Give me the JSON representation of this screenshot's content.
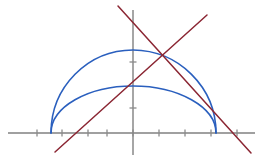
{
  "figure": {
    "name": "semicircle-and-ellipse-with-crossing-lines",
    "width": 262,
    "height": 160,
    "background": "#ffffff"
  },
  "chart_data": {
    "type": "line",
    "title": "",
    "subtitle": "",
    "xlabel": "",
    "ylabel": "",
    "grid": false,
    "legend": "none",
    "axes": {
      "origin_px": [
        133,
        133
      ],
      "x_axis": {
        "y_px": 133,
        "x_start_px": 8,
        "x_end_px": 255,
        "xlim": [
          -4.9,
          4.7
        ],
        "tick_spacing_units": 1,
        "tick_values": [
          -4,
          -3,
          -2,
          -1,
          0,
          1,
          2,
          3,
          4
        ],
        "tick_positions_px": [
          37,
          62,
          88,
          107,
          133,
          159,
          185,
          211,
          237
        ],
        "tick_length_px": 7,
        "tick_labels_visible": false
      },
      "y_axis": {
        "x_px": 133,
        "y_start_px": 10,
        "y_end_px": 155,
        "ylim": [
          -0.85,
          4.7
        ],
        "tick_values": [
          1,
          2
        ],
        "tick_positions_px": [
          108,
          62
        ],
        "tick_length_px": 7,
        "tick_labels_visible": false
      },
      "axis_color": "#808080",
      "axis_width_px": 1.4
    },
    "series": [
      {
        "name": "upper-arc-semicircle",
        "role": "semicircle of radius ~3.2 centered near origin",
        "color": "#2a5fbe",
        "width_px": 1.6,
        "type": "arc",
        "start_point_px": [
          51,
          133
        ],
        "end_point_px": [
          216,
          133
        ],
        "apex_px": [
          133,
          50
        ],
        "x_domain_units": [
          -3.2,
          3.2
        ],
        "peak_value_units": 3.2
      },
      {
        "name": "lower-arc-ellipse",
        "role": "flatter ellipse sharing the same x-intercepts",
        "color": "#2a5fbe",
        "width_px": 1.6,
        "type": "arc",
        "start_point_px": [
          51,
          133
        ],
        "end_point_px": [
          216,
          133
        ],
        "apex_px": [
          133,
          86
        ],
        "x_domain_units": [
          -3.2,
          3.2
        ],
        "peak_value_units": 1.8
      },
      {
        "name": "ascending-line",
        "role": "line with positive slope through the arcs",
        "color": "#8b2633",
        "width_px": 1.5,
        "type": "line",
        "start_point_px": [
          55,
          152
        ],
        "end_point_px": [
          207,
          15
        ],
        "slope_units": 0.9
      },
      {
        "name": "descending-line",
        "role": "line with negative slope through the arcs",
        "color": "#8b2633",
        "width_px": 1.5,
        "type": "line",
        "start_point_px": [
          118,
          6
        ],
        "end_point_px": [
          251,
          153
        ],
        "slope_units": -1.1
      }
    ],
    "annotations": [
      {
        "name": "line-intersection",
        "point_px": [
          162,
          58
        ],
        "visible_marker": false
      },
      {
        "name": "left-x-intercept",
        "point_px": [
          51,
          133
        ],
        "visible_marker": false
      },
      {
        "name": "right-x-intercept",
        "point_px": [
          216,
          133
        ],
        "visible_marker": false
      }
    ]
  }
}
